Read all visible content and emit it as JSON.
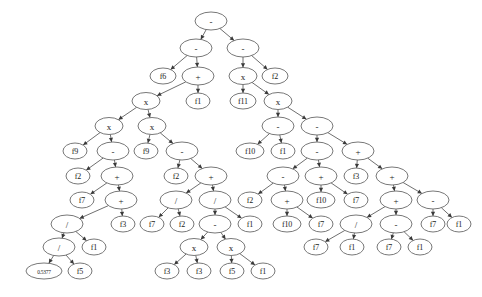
{
  "figure": {
    "kind": "expression-tree",
    "title": "",
    "background_color": "#ffffff",
    "node_fill": "#ffffff",
    "node_stroke": "#555555",
    "edge_color": "#4a4a4a",
    "text_color": "#1a1a1a"
  },
  "chart_data": {
    "type": "diagram",
    "title": "",
    "operators": [
      "-",
      "+",
      "x",
      "/"
    ],
    "terminals": [
      "f1",
      "f2",
      "f3",
      "f5",
      "f6",
      "f7",
      "f9",
      "f10",
      "f11",
      "0.5377"
    ],
    "node_count": 81
  },
  "nodes": [
    {
      "id": "n0",
      "label": "-",
      "x": 211,
      "y": 21,
      "rx": 16,
      "ry": 9,
      "kind": "operator"
    },
    {
      "id": "n1",
      "label": "-",
      "x": 196,
      "y": 48,
      "rx": 16,
      "ry": 9,
      "kind": "operator"
    },
    {
      "id": "n2",
      "label": "-",
      "x": 243,
      "y": 48,
      "rx": 16,
      "ry": 9,
      "kind": "operator"
    },
    {
      "id": "n3",
      "label": "f6",
      "x": 163,
      "y": 76,
      "rx": 13,
      "ry": 8,
      "kind": "terminal"
    },
    {
      "id": "n4",
      "label": "+",
      "x": 198,
      "y": 76,
      "rx": 16,
      "ry": 9,
      "kind": "operator"
    },
    {
      "id": "n5",
      "label": "x",
      "x": 243,
      "y": 76,
      "rx": 14,
      "ry": 8.5,
      "kind": "operator"
    },
    {
      "id": "n6",
      "label": "f2",
      "x": 275,
      "y": 76,
      "rx": 13,
      "ry": 8,
      "kind": "terminal"
    },
    {
      "id": "n7",
      "label": "x",
      "x": 146,
      "y": 101,
      "rx": 14,
      "ry": 8.5,
      "kind": "operator"
    },
    {
      "id": "n8",
      "label": "f1",
      "x": 198,
      "y": 101,
      "rx": 12,
      "ry": 8,
      "kind": "terminal"
    },
    {
      "id": "n9",
      "label": "f11",
      "x": 243,
      "y": 101,
      "rx": 13,
      "ry": 8,
      "kind": "terminal"
    },
    {
      "id": "n10",
      "label": "x",
      "x": 278,
      "y": 101,
      "rx": 14,
      "ry": 8.5,
      "kind": "operator"
    },
    {
      "id": "n11",
      "label": "x",
      "x": 109,
      "y": 126,
      "rx": 14,
      "ry": 8.5,
      "kind": "operator"
    },
    {
      "id": "n12",
      "label": "x",
      "x": 152,
      "y": 126,
      "rx": 14,
      "ry": 8.5,
      "kind": "operator"
    },
    {
      "id": "n13",
      "label": "-",
      "x": 278,
      "y": 126,
      "rx": 16,
      "ry": 9,
      "kind": "operator"
    },
    {
      "id": "n14",
      "label": "-",
      "x": 317,
      "y": 126,
      "rx": 16,
      "ry": 9,
      "kind": "operator"
    },
    {
      "id": "n15",
      "label": "f9",
      "x": 75,
      "y": 151,
      "rx": 12,
      "ry": 8,
      "kind": "terminal"
    },
    {
      "id": "n16",
      "label": "-",
      "x": 113,
      "y": 151,
      "rx": 16,
      "ry": 9,
      "kind": "operator"
    },
    {
      "id": "n17",
      "label": "f9",
      "x": 146,
      "y": 151,
      "rx": 12,
      "ry": 8,
      "kind": "terminal"
    },
    {
      "id": "n18",
      "label": "-",
      "x": 182,
      "y": 151,
      "rx": 16,
      "ry": 9,
      "kind": "operator"
    },
    {
      "id": "n19",
      "label": "f10",
      "x": 250,
      "y": 151,
      "rx": 14,
      "ry": 8,
      "kind": "terminal"
    },
    {
      "id": "n20",
      "label": "f1",
      "x": 283,
      "y": 151,
      "rx": 12,
      "ry": 8,
      "kind": "terminal"
    },
    {
      "id": "n21",
      "label": "-",
      "x": 317,
      "y": 151,
      "rx": 16,
      "ry": 9,
      "kind": "operator"
    },
    {
      "id": "n22",
      "label": "+",
      "x": 358,
      "y": 151,
      "rx": 16,
      "ry": 9,
      "kind": "operator"
    },
    {
      "id": "n23",
      "label": "f2",
      "x": 78,
      "y": 176,
      "rx": 12,
      "ry": 8,
      "kind": "terminal"
    },
    {
      "id": "n24",
      "label": "+",
      "x": 117,
      "y": 176,
      "rx": 16,
      "ry": 9,
      "kind": "operator"
    },
    {
      "id": "n25",
      "label": "f2",
      "x": 176,
      "y": 176,
      "rx": 12,
      "ry": 8,
      "kind": "terminal"
    },
    {
      "id": "n26",
      "label": "+",
      "x": 211,
      "y": 176,
      "rx": 16,
      "ry": 9,
      "kind": "operator"
    },
    {
      "id": "n27",
      "label": "-",
      "x": 283,
      "y": 176,
      "rx": 16,
      "ry": 9,
      "kind": "operator"
    },
    {
      "id": "n28",
      "label": "+",
      "x": 321,
      "y": 176,
      "rx": 16,
      "ry": 9,
      "kind": "operator"
    },
    {
      "id": "n29",
      "label": "f3",
      "x": 356,
      "y": 176,
      "rx": 12,
      "ry": 8,
      "kind": "terminal"
    },
    {
      "id": "n30",
      "label": "+",
      "x": 392,
      "y": 176,
      "rx": 16,
      "ry": 9,
      "kind": "operator"
    },
    {
      "id": "n31",
      "label": "f7",
      "x": 82,
      "y": 200,
      "rx": 12,
      "ry": 8,
      "kind": "terminal"
    },
    {
      "id": "n32",
      "label": "+",
      "x": 121,
      "y": 200,
      "rx": 16,
      "ry": 9,
      "kind": "operator"
    },
    {
      "id": "n33",
      "label": "/",
      "x": 176,
      "y": 200,
      "rx": 16,
      "ry": 9,
      "kind": "operator"
    },
    {
      "id": "n34",
      "label": "/",
      "x": 215,
      "y": 200,
      "rx": 16,
      "ry": 9,
      "kind": "operator"
    },
    {
      "id": "n35",
      "label": "f2",
      "x": 250,
      "y": 200,
      "rx": 12,
      "ry": 8,
      "kind": "terminal"
    },
    {
      "id": "n36",
      "label": "+",
      "x": 287,
      "y": 200,
      "rx": 16,
      "ry": 9,
      "kind": "operator"
    },
    {
      "id": "n37",
      "label": "f10",
      "x": 321,
      "y": 200,
      "rx": 14,
      "ry": 8,
      "kind": "terminal"
    },
    {
      "id": "n38",
      "label": "f7",
      "x": 356,
      "y": 200,
      "rx": 12,
      "ry": 8,
      "kind": "terminal"
    },
    {
      "id": "n39",
      "label": "+",
      "x": 396,
      "y": 200,
      "rx": 16,
      "ry": 9,
      "kind": "operator"
    },
    {
      "id": "n40",
      "label": "-",
      "x": 433,
      "y": 200,
      "rx": 16,
      "ry": 9,
      "kind": "operator"
    },
    {
      "id": "n41",
      "label": "/",
      "x": 67,
      "y": 224,
      "rx": 16,
      "ry": 9,
      "kind": "operator"
    },
    {
      "id": "n42",
      "label": "f3",
      "x": 123,
      "y": 224,
      "rx": 12,
      "ry": 8,
      "kind": "terminal"
    },
    {
      "id": "n43",
      "label": "f7",
      "x": 152,
      "y": 224,
      "rx": 12,
      "ry": 8,
      "kind": "terminal"
    },
    {
      "id": "n44",
      "label": "f2",
      "x": 182,
      "y": 224,
      "rx": 12,
      "ry": 8,
      "kind": "terminal"
    },
    {
      "id": "n45",
      "label": "-",
      "x": 215,
      "y": 224,
      "rx": 16,
      "ry": 9,
      "kind": "operator"
    },
    {
      "id": "n46",
      "label": "f1",
      "x": 250,
      "y": 224,
      "rx": 12,
      "ry": 8,
      "kind": "terminal"
    },
    {
      "id": "n47",
      "label": "f10",
      "x": 287,
      "y": 224,
      "rx": 14,
      "ry": 8,
      "kind": "terminal"
    },
    {
      "id": "n48",
      "label": "f7",
      "x": 321,
      "y": 224,
      "rx": 12,
      "ry": 8,
      "kind": "terminal"
    },
    {
      "id": "n49",
      "label": "/",
      "x": 356,
      "y": 224,
      "rx": 16,
      "ry": 9,
      "kind": "operator"
    },
    {
      "id": "n50",
      "label": "-",
      "x": 396,
      "y": 224,
      "rx": 16,
      "ry": 9,
      "kind": "operator"
    },
    {
      "id": "n51",
      "label": "f7",
      "x": 433,
      "y": 224,
      "rx": 12,
      "ry": 8,
      "kind": "terminal"
    },
    {
      "id": "n52",
      "label": "f1",
      "x": 459,
      "y": 224,
      "rx": 12,
      "ry": 8,
      "kind": "terminal"
    },
    {
      "id": "n53",
      "label": "/",
      "x": 59,
      "y": 247,
      "rx": 16,
      "ry": 9,
      "kind": "operator"
    },
    {
      "id": "n54",
      "label": "f1",
      "x": 94,
      "y": 247,
      "rx": 12,
      "ry": 8,
      "kind": "terminal"
    },
    {
      "id": "n55",
      "label": "x",
      "x": 194,
      "y": 247,
      "rx": 14,
      "ry": 8.5,
      "kind": "operator"
    },
    {
      "id": "n56",
      "label": "x",
      "x": 231,
      "y": 247,
      "rx": 14,
      "ry": 8.5,
      "kind": "operator"
    },
    {
      "id": "n57",
      "label": "f7",
      "x": 316,
      "y": 247,
      "rx": 12,
      "ry": 8,
      "kind": "terminal"
    },
    {
      "id": "n58",
      "label": "f1",
      "x": 352,
      "y": 247,
      "rx": 12,
      "ry": 8,
      "kind": "terminal"
    },
    {
      "id": "n59",
      "label": "f7",
      "x": 389,
      "y": 247,
      "rx": 12,
      "ry": 8,
      "kind": "terminal"
    },
    {
      "id": "n60",
      "label": "f1",
      "x": 420,
      "y": 247,
      "rx": 12,
      "ry": 8,
      "kind": "terminal"
    },
    {
      "id": "n61",
      "label": "0.5377",
      "x": 44,
      "y": 271,
      "rx": 18,
      "ry": 8,
      "kind": "constant"
    },
    {
      "id": "n62",
      "label": "f5",
      "x": 80,
      "y": 271,
      "rx": 12,
      "ry": 8,
      "kind": "terminal"
    },
    {
      "id": "n63",
      "label": "f3",
      "x": 167,
      "y": 271,
      "rx": 12,
      "ry": 8,
      "kind": "terminal"
    },
    {
      "id": "n64",
      "label": "f3",
      "x": 199,
      "y": 271,
      "rx": 12,
      "ry": 8,
      "kind": "terminal"
    },
    {
      "id": "n65",
      "label": "f5",
      "x": 232,
      "y": 271,
      "rx": 12,
      "ry": 8,
      "kind": "terminal"
    },
    {
      "id": "n66",
      "label": "f1",
      "x": 263,
      "y": 271,
      "rx": 12,
      "ry": 8,
      "kind": "terminal"
    }
  ],
  "edges": [
    {
      "from": "n0",
      "to": "n1"
    },
    {
      "from": "n0",
      "to": "n2"
    },
    {
      "from": "n1",
      "to": "n3"
    },
    {
      "from": "n1",
      "to": "n4"
    },
    {
      "from": "n2",
      "to": "n5"
    },
    {
      "from": "n2",
      "to": "n6"
    },
    {
      "from": "n4",
      "to": "n7"
    },
    {
      "from": "n4",
      "to": "n8"
    },
    {
      "from": "n5",
      "to": "n9"
    },
    {
      "from": "n5",
      "to": "n10"
    },
    {
      "from": "n7",
      "to": "n11"
    },
    {
      "from": "n7",
      "to": "n12"
    },
    {
      "from": "n10",
      "to": "n13"
    },
    {
      "from": "n10",
      "to": "n14"
    },
    {
      "from": "n11",
      "to": "n15"
    },
    {
      "from": "n11",
      "to": "n16"
    },
    {
      "from": "n12",
      "to": "n17"
    },
    {
      "from": "n12",
      "to": "n18"
    },
    {
      "from": "n13",
      "to": "n19"
    },
    {
      "from": "n13",
      "to": "n20"
    },
    {
      "from": "n14",
      "to": "n21"
    },
    {
      "from": "n14",
      "to": "n22"
    },
    {
      "from": "n16",
      "to": "n23"
    },
    {
      "from": "n16",
      "to": "n24"
    },
    {
      "from": "n18",
      "to": "n25"
    },
    {
      "from": "n18",
      "to": "n26"
    },
    {
      "from": "n21",
      "to": "n27"
    },
    {
      "from": "n21",
      "to": "n28"
    },
    {
      "from": "n22",
      "to": "n29"
    },
    {
      "from": "n22",
      "to": "n30"
    },
    {
      "from": "n24",
      "to": "n31"
    },
    {
      "from": "n24",
      "to": "n32"
    },
    {
      "from": "n26",
      "to": "n33"
    },
    {
      "from": "n26",
      "to": "n34"
    },
    {
      "from": "n27",
      "to": "n35"
    },
    {
      "from": "n27",
      "to": "n36"
    },
    {
      "from": "n28",
      "to": "n37"
    },
    {
      "from": "n28",
      "to": "n38"
    },
    {
      "from": "n30",
      "to": "n39"
    },
    {
      "from": "n30",
      "to": "n40"
    },
    {
      "from": "n32",
      "to": "n41"
    },
    {
      "from": "n32",
      "to": "n42"
    },
    {
      "from": "n33",
      "to": "n43"
    },
    {
      "from": "n33",
      "to": "n44"
    },
    {
      "from": "n34",
      "to": "n45"
    },
    {
      "from": "n34",
      "to": "n46"
    },
    {
      "from": "n36",
      "to": "n47"
    },
    {
      "from": "n36",
      "to": "n48"
    },
    {
      "from": "n39",
      "to": "n49"
    },
    {
      "from": "n39",
      "to": "n50"
    },
    {
      "from": "n40",
      "to": "n51"
    },
    {
      "from": "n40",
      "to": "n52"
    },
    {
      "from": "n41",
      "to": "n53"
    },
    {
      "from": "n41",
      "to": "n54"
    },
    {
      "from": "n45",
      "to": "n55"
    },
    {
      "from": "n45",
      "to": "n56"
    },
    {
      "from": "n49",
      "to": "n57"
    },
    {
      "from": "n49",
      "to": "n58"
    },
    {
      "from": "n50",
      "to": "n59"
    },
    {
      "from": "n50",
      "to": "n60"
    },
    {
      "from": "n53",
      "to": "n61"
    },
    {
      "from": "n53",
      "to": "n62"
    },
    {
      "from": "n55",
      "to": "n63"
    },
    {
      "from": "n55",
      "to": "n64"
    },
    {
      "from": "n56",
      "to": "n65"
    },
    {
      "from": "n56",
      "to": "n66"
    }
  ]
}
